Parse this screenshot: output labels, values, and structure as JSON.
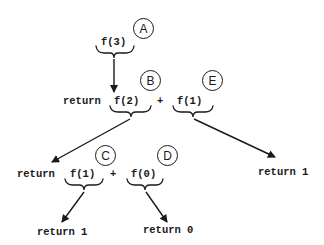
{
  "diagram": {
    "type": "recursion-tree",
    "nodes": {
      "root": {
        "call": "f(3)",
        "label": "A"
      },
      "level1": {
        "return_kw": "return",
        "left_call": "f(2)",
        "left_label": "B",
        "operator": "+",
        "right_call": "f(1)",
        "right_label": "E"
      },
      "level2": {
        "return_kw": "return",
        "left_call": "f(1)",
        "left_label": "C",
        "operator": "+",
        "right_call": "f(0)",
        "right_label": "D"
      },
      "right_leaf": {
        "text": "return 1"
      },
      "leaf_left": {
        "text": "return 1"
      },
      "leaf_right": {
        "text": "return 0"
      }
    },
    "edges": [
      {
        "from": "A",
        "to": "level1"
      },
      {
        "from": "B",
        "to": "level2"
      },
      {
        "from": "E",
        "to": "right_leaf"
      },
      {
        "from": "C",
        "to": "leaf_left"
      },
      {
        "from": "D",
        "to": "leaf_right"
      }
    ],
    "colors": {
      "ink": "#1a1a1a",
      "background": "#ffffff"
    }
  }
}
